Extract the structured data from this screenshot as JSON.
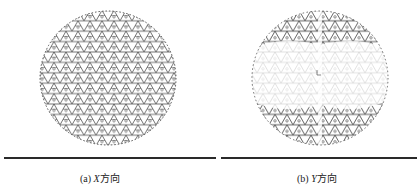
{
  "figure": {
    "panels": [
      {
        "id": "a",
        "label": "(a)",
        "axis": "X",
        "direction_text": "方向",
        "caption": "(a) X方向"
      },
      {
        "id": "b",
        "label": "(b)",
        "axis": "Y",
        "direction_text": "方向",
        "caption": "(b) Y方向"
      }
    ],
    "colors": {
      "lattice_dark": "#3a3a3a",
      "lattice_light": "#c8c8c8",
      "rule": "#2a2a2a",
      "background": "#ffffff"
    }
  }
}
